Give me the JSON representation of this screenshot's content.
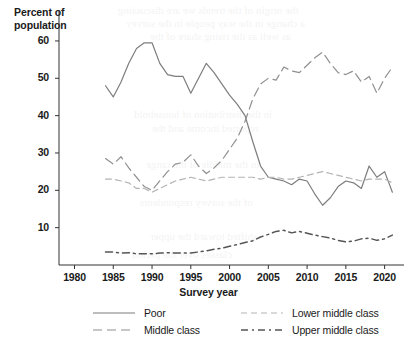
{
  "axes": {
    "ylabel": "Percent of\npopulation",
    "xlabel": "Survey year",
    "yticks": [
      "60",
      "50",
      "40",
      "30",
      "20",
      "10"
    ],
    "xticks": [
      "1980",
      "1985",
      "1990",
      "1995",
      "2000",
      "2005",
      "2010",
      "2015",
      "2020"
    ]
  },
  "legend": {
    "poor": "Poor",
    "middle": "Middle class",
    "lower_middle": "Lower middle class",
    "upper_middle": "Upper middle class"
  },
  "chart_data": {
    "type": "line",
    "title": "",
    "xlabel": "Survey year",
    "ylabel": "Percent of population",
    "xlim": [
      1978,
      2022.5
    ],
    "ylim": [
      0,
      64
    ],
    "yticks": [
      10,
      20,
      30,
      40,
      50,
      60
    ],
    "xticks": [
      1980,
      1985,
      1990,
      1995,
      2000,
      2005,
      2010,
      2015,
      2020
    ],
    "grid": false,
    "legend_position": "bottom",
    "x": [
      1984,
      1985,
      1986,
      1987,
      1988,
      1989,
      1990,
      1991,
      1992,
      1993,
      1994,
      1995,
      1996,
      1997,
      1998,
      1999,
      2000,
      2001,
      2002,
      2003,
      2004,
      2005,
      2006,
      2007,
      2008,
      2009,
      2010,
      2011,
      2012,
      2013,
      2014,
      2015,
      2016,
      2017,
      2018,
      2019,
      2020,
      2021
    ],
    "series": [
      {
        "name": "Poor",
        "style": "solid",
        "color": "#7d7d7d",
        "values": [
          48.0,
          45.0,
          49.0,
          54.0,
          58.0,
          59.5,
          59.5,
          54.0,
          51.0,
          50.5,
          50.5,
          46.0,
          50.0,
          54.0,
          51.5,
          48.5,
          45.5,
          43.0,
          40.0,
          33.0,
          26.5,
          23.5,
          23.0,
          22.5,
          21.5,
          23.0,
          22.5,
          19.0,
          16.0,
          18.0,
          21.0,
          22.5,
          22.0,
          20.5,
          26.5,
          23.5,
          25.0,
          19.5
        ]
      },
      {
        "name": "Middle class",
        "style": "long-dash",
        "color": "#909090",
        "values": [
          28.5,
          27.0,
          29.0,
          26.0,
          23.5,
          21.0,
          20.0,
          22.5,
          25.0,
          27.0,
          27.5,
          29.5,
          26.5,
          24.5,
          26.0,
          28.0,
          31.0,
          34.0,
          38.5,
          44.5,
          48.5,
          50.0,
          49.5,
          53.0,
          52.0,
          51.5,
          53.5,
          55.5,
          57.0,
          54.0,
          51.5,
          51.0,
          52.0,
          49.0,
          50.5,
          46.0,
          50.0,
          53.0
        ]
      },
      {
        "name": "Lower middle class",
        "style": "short-dash",
        "color": "#b4b4b4",
        "values": [
          23.0,
          23.0,
          22.5,
          22.0,
          20.5,
          20.5,
          19.5,
          20.5,
          21.5,
          22.5,
          23.0,
          23.5,
          23.0,
          22.5,
          23.0,
          23.5,
          23.5,
          23.5,
          23.5,
          23.5,
          23.0,
          23.5,
          23.5,
          23.0,
          23.0,
          23.5,
          24.0,
          24.5,
          25.0,
          24.5,
          24.0,
          23.5,
          23.0,
          22.5,
          23.0,
          23.0,
          23.0,
          22.0
        ]
      },
      {
        "name": "Upper middle class",
        "style": "dash-dot",
        "color": "#555555",
        "values": [
          3.5,
          3.5,
          3.2,
          3.3,
          3.0,
          3.0,
          3.0,
          3.2,
          3.3,
          3.2,
          3.2,
          3.2,
          3.5,
          3.8,
          4.2,
          4.5,
          5.0,
          5.5,
          6.0,
          6.5,
          7.5,
          8.2,
          9.0,
          9.3,
          8.6,
          9.0,
          8.5,
          8.0,
          7.6,
          7.2,
          6.6,
          6.2,
          6.4,
          7.0,
          7.2,
          6.6,
          7.0,
          8.0
        ]
      }
    ]
  },
  "bleed_lines": [
    {
      "text": "the origin of the trends we are discussing",
      "x": 118,
      "y": 4
    },
    {
      "text": "a change in the way people in the survey",
      "x": 126,
      "y": 17
    },
    {
      "text": "as well as the rising share of the",
      "x": 150,
      "y": 30
    },
    {
      "text": "in the distribution of household",
      "x": 134,
      "y": 108
    },
    {
      "text": "reported income and the",
      "x": 152,
      "y": 122
    },
    {
      "text": "in the middle of the range",
      "x": 146,
      "y": 158
    },
    {
      "text": "of the survey respondents",
      "x": 140,
      "y": 196
    },
    {
      "text": "shifted toward the upper",
      "x": 150,
      "y": 230
    },
    {
      "text": "classes over the period",
      "x": 132,
      "y": 248
    }
  ]
}
